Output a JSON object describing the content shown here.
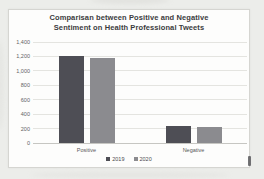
{
  "chart_data": {
    "type": "bar",
    "title": "Comparisan between Positive and Negative Sentiment on Health Professional Tweets",
    "title_lines": [
      "Comparisan between Positive and Negative",
      "Sentiment on Health Professional Tweets"
    ],
    "categories": [
      "Positive",
      "Negative"
    ],
    "series": [
      {
        "name": "2019",
        "values": [
          1200,
          240
        ],
        "color": "#4e4e55"
      },
      {
        "name": "2020",
        "values": [
          1180,
          225
        ],
        "color": "#8b8b8f"
      }
    ],
    "xlabel": "",
    "ylabel": "",
    "ylim": [
      0,
      1400
    ],
    "ytick_step": 200,
    "ytick_labels": [
      "0",
      "200",
      "400",
      "600",
      "800",
      "1,000",
      "1,200",
      "1,400"
    ],
    "grid": true,
    "legend_position": "bottom"
  },
  "colors": {
    "page_background": "#ecedea",
    "chart_background": "#fdfdfc",
    "gridline": "#e4e4e0",
    "title_text": "#3b3b3d"
  }
}
